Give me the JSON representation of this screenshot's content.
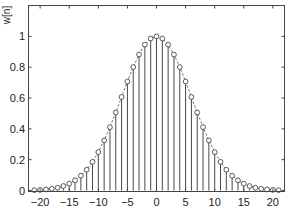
{
  "chart_data": {
    "type": "stem",
    "title": "",
    "xlabel": "",
    "ylabel": "w[n]",
    "xlim": [
      -22,
      22
    ],
    "ylim": [
      0,
      1.2
    ],
    "grid": false,
    "legend": null,
    "x_ticks": [
      -20,
      -15,
      -10,
      -5,
      0,
      5,
      10,
      15,
      20
    ],
    "x_tick_labels": [
      "−20",
      "−15",
      "−10",
      "−5",
      "0",
      "5",
      "10",
      "15",
      "20"
    ],
    "y_ticks": [
      0,
      0.2,
      0.4,
      0.6,
      0.8,
      1
    ],
    "y_tick_labels": [
      "0",
      "0.2",
      "0.4",
      "0.6",
      "0.8",
      "1"
    ],
    "series": [
      {
        "name": "w[n]",
        "style": "stem with open circle markers and dashed envelope",
        "x": [
          -21,
          -20,
          -19,
          -18,
          -17,
          -16,
          -15,
          -14,
          -13,
          -12,
          -11,
          -10,
          -9,
          -8,
          -7,
          -6,
          -5,
          -4,
          -3,
          -2,
          -1,
          0,
          1,
          2,
          3,
          4,
          5,
          6,
          7,
          8,
          9,
          10,
          11,
          12,
          13,
          14,
          15,
          16,
          17,
          18,
          19,
          20,
          21
        ],
        "values": [
          0.002,
          0.004,
          0.007,
          0.011,
          0.018,
          0.029,
          0.044,
          0.066,
          0.096,
          0.135,
          0.186,
          0.249,
          0.325,
          0.411,
          0.506,
          0.607,
          0.707,
          0.801,
          0.882,
          0.946,
          0.986,
          1.0,
          0.986,
          0.946,
          0.882,
          0.801,
          0.707,
          0.607,
          0.506,
          0.411,
          0.325,
          0.249,
          0.186,
          0.135,
          0.096,
          0.066,
          0.044,
          0.029,
          0.018,
          0.011,
          0.007,
          0.004,
          0.002
        ]
      }
    ]
  }
}
